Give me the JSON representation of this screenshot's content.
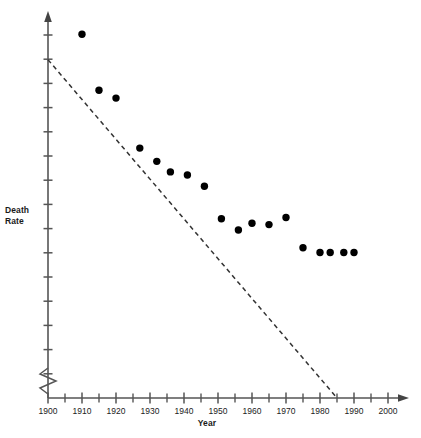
{
  "chart_data": {
    "type": "scatter",
    "title": "",
    "xlabel": "Year",
    "ylabel": "Death\nRate",
    "ylabel_lines": [
      "Death",
      "Rate"
    ],
    "xlim": [
      1900,
      2000
    ],
    "ylim": [
      0,
      11
    ],
    "grid": false,
    "legend": null,
    "x_tick_labels": [
      "1900",
      "1910",
      "1920",
      "1930",
      "1940",
      "1950",
      "1960",
      "1970",
      "1980",
      "1990",
      "2000"
    ],
    "x_tick_values": [
      1900,
      1910,
      1920,
      1930,
      1940,
      1950,
      1960,
      1970,
      1980,
      1990,
      2000
    ],
    "x_minor_tick_values": [
      1905,
      1915,
      1925,
      1935,
      1945,
      1955,
      1965,
      1975,
      1985,
      1995
    ],
    "y_tick_labels": [],
    "y_axis_note": "unlabeled evenly spaced tick marks, arrow head at top, zigzag scale-break symbol just above the x-axis",
    "y_axis_broken": true,
    "x": [
      1910,
      1915,
      1920,
      1927,
      1932,
      1936,
      1941,
      1946,
      1951,
      1956,
      1960,
      1965,
      1970,
      1975,
      1980,
      1983,
      1987,
      1990
    ],
    "y": [
      10.7,
      9.05,
      8.82,
      7.35,
      6.96,
      6.65,
      6.56,
      6.23,
      5.27,
      4.94,
      5.14,
      5.1,
      5.31,
      4.42,
      4.28,
      4.28,
      4.28,
      4.28
    ],
    "values": [
      10.7,
      9.05,
      8.82,
      7.35,
      6.96,
      6.65,
      6.56,
      6.23,
      5.27,
      4.94,
      5.14,
      5.1,
      5.31,
      4.42,
      4.28,
      4.28,
      4.28,
      4.28
    ],
    "series": [
      {
        "name": "Death Rate",
        "marker": "filled-circle",
        "color": "#000000",
        "points": [
          {
            "x": 1910,
            "y": 10.7
          },
          {
            "x": 1915,
            "y": 9.05
          },
          {
            "x": 1920,
            "y": 8.82
          },
          {
            "x": 1927,
            "y": 7.35
          },
          {
            "x": 1932,
            "y": 6.96
          },
          {
            "x": 1936,
            "y": 6.65
          },
          {
            "x": 1941,
            "y": 6.56
          },
          {
            "x": 1946,
            "y": 6.23
          },
          {
            "x": 1951,
            "y": 5.27
          },
          {
            "x": 1956,
            "y": 4.94
          },
          {
            "x": 1960,
            "y": 5.14
          },
          {
            "x": 1965,
            "y": 5.1
          },
          {
            "x": 1970,
            "y": 5.31
          },
          {
            "x": 1975,
            "y": 4.42
          },
          {
            "x": 1980,
            "y": 4.28
          },
          {
            "x": 1983,
            "y": 4.28
          },
          {
            "x": 1987,
            "y": 4.28
          },
          {
            "x": 1990,
            "y": 4.28
          }
        ]
      }
    ],
    "trend_line": {
      "style": "dashed",
      "color": "#333333",
      "start": {
        "x": 1900,
        "y": 9.95
      },
      "end": {
        "x": 1985,
        "y": 0.0
      }
    },
    "colors": {
      "marker": "#000000",
      "axis": "#555555",
      "trend": "#333333",
      "text": "#1a1a1a",
      "background": "#ffffff"
    }
  }
}
